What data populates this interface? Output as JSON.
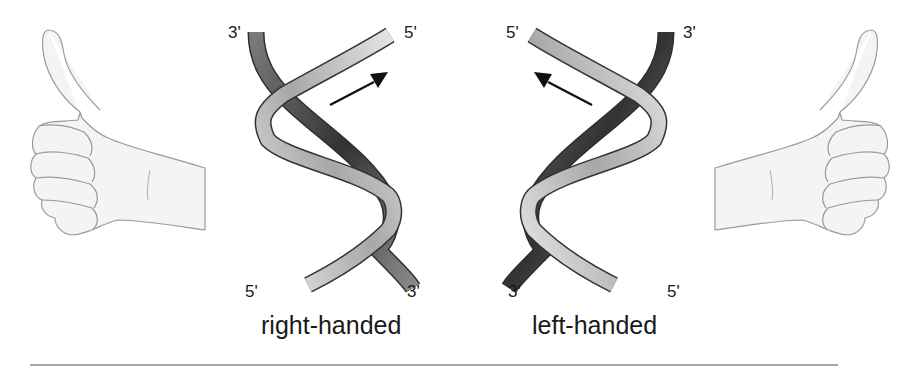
{
  "figure": {
    "panels": [
      {
        "id": "right-handed",
        "caption": "right-handed",
        "labels": {
          "top_left": "3'",
          "top_right": "5'",
          "bottom_left": "5'",
          "bottom_right": "3'"
        },
        "arrow_direction": "up-right"
      },
      {
        "id": "left-handed",
        "caption": "left-handed",
        "labels": {
          "top_left": "5'",
          "top_right": "3'",
          "bottom_left": "3'",
          "bottom_right": "5'"
        },
        "arrow_direction": "up-left"
      }
    ],
    "icons": {
      "left_hand": "thumbs-up-left-hand-icon",
      "right_hand": "thumbs-up-right-hand-icon",
      "arrow": "arrow-icon"
    },
    "colors": {
      "strand_front": "#c9c9c9",
      "strand_back": "#3f3f3f",
      "strand_outline": "#333333",
      "hand_fill": "#f3f3f3",
      "hand_outline": "#9a9a9a",
      "text": "#1a1a1a",
      "rule": "#a8a8a8"
    }
  }
}
